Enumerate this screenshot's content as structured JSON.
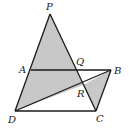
{
  "diagram": {
    "type": "geometry",
    "fill_color": "#c8c8c8",
    "stroke_color": "#1a1a1a",
    "points": {
      "P": {
        "label": "P",
        "x": 50,
        "y": 14
      },
      "A": {
        "label": "A",
        "x": 31,
        "y": 70
      },
      "Q": {
        "label": "Q",
        "x": 77,
        "y": 70
      },
      "B": {
        "label": "B",
        "x": 111,
        "y": 70
      },
      "R": {
        "label": "R",
        "x": 83,
        "y": 85
      },
      "D": {
        "label": "D",
        "x": 15,
        "y": 111
      },
      "C": {
        "label": "C",
        "x": 96,
        "y": 111
      }
    },
    "segments": [
      "PD",
      "PC",
      "AB",
      "DB",
      "DC",
      "BC"
    ],
    "shaded_regions": [
      "PDRQ",
      "BRC"
    ]
  }
}
